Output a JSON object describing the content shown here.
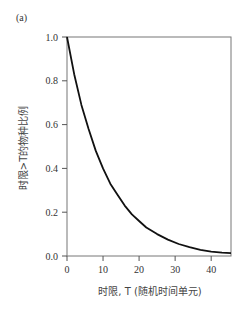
{
  "panel_label": "(a)",
  "chart_data": {
    "type": "line",
    "title": "",
    "xlabel": "时限, T (随机时间单元)",
    "ylabel": "时限>T的物种比例",
    "xlim": [
      0,
      45.5
    ],
    "ylim": [
      0,
      1.0
    ],
    "xticks": [
      0,
      10,
      20,
      30,
      40
    ],
    "yticks": [
      "0.0",
      "0.2",
      "0.4",
      "0.6",
      "0.8",
      "1.0"
    ],
    "grid": false,
    "legend": null,
    "series": [
      {
        "name": "survival",
        "x": [
          0,
          2,
          4,
          6,
          8,
          10,
          12,
          14,
          16,
          18,
          20,
          22,
          25,
          28,
          31,
          34,
          37,
          40,
          43,
          45.5
        ],
        "y": [
          1.0,
          0.83,
          0.69,
          0.58,
          0.48,
          0.4,
          0.33,
          0.28,
          0.23,
          0.19,
          0.16,
          0.13,
          0.1,
          0.075,
          0.055,
          0.04,
          0.028,
          0.02,
          0.015,
          0.013
        ]
      }
    ]
  }
}
